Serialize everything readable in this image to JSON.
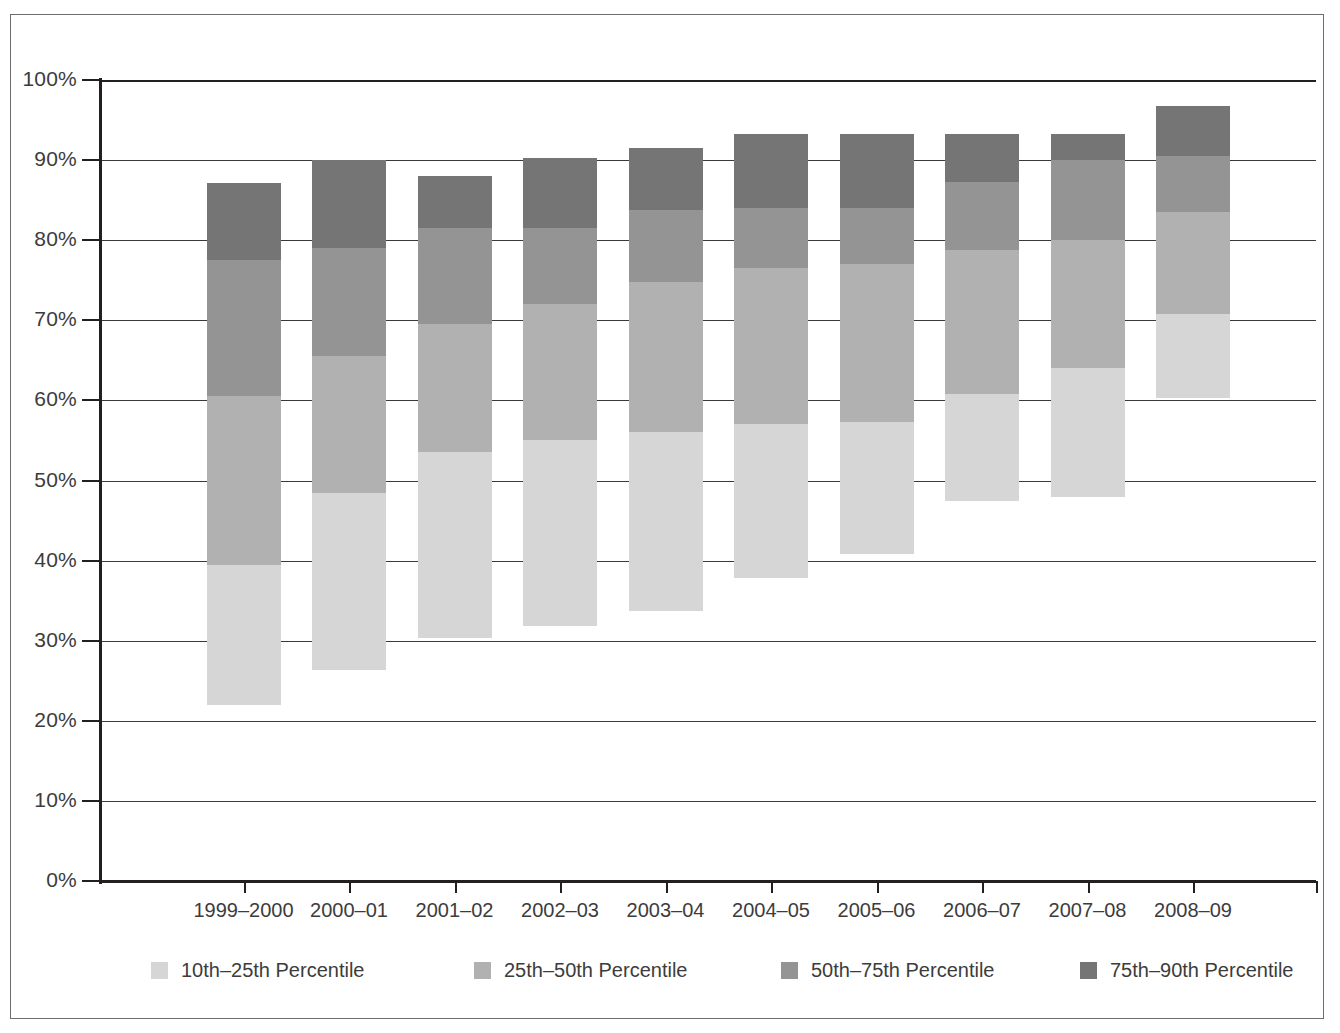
{
  "chart_data": {
    "type": "bar",
    "subtype": "stacked-bar",
    "title": "",
    "xlabel": "",
    "ylabel": "",
    "ylim": [
      0,
      100
    ],
    "y_unit": "%",
    "grid": true,
    "legend_position": "bottom",
    "y_ticks": [
      "0%",
      "10%",
      "20%",
      "30%",
      "40%",
      "50%",
      "60%",
      "70%",
      "80%",
      "90%",
      "100%"
    ],
    "y_tick_values": [
      0,
      10,
      20,
      30,
      40,
      50,
      60,
      70,
      80,
      90,
      100
    ],
    "categories": [
      "1999–2000",
      "2000–01",
      "2001–02",
      "2002–03",
      "2003–04",
      "2004–05",
      "2005–06",
      "2006–07",
      "2007–08",
      "2008–09"
    ],
    "series": [
      {
        "name": "10th–25th Percentile",
        "color": "#d6d6d6",
        "baselines": [
          22.0,
          26.3,
          30.3,
          31.8,
          33.7,
          37.8,
          40.8,
          47.5,
          48.0,
          60.3
        ],
        "tops": [
          39.5,
          48.5,
          53.5,
          55.0,
          56.0,
          57.0,
          57.3,
          60.8,
          64.0,
          70.8
        ],
        "values": [
          17.5,
          22.2,
          23.2,
          23.2,
          22.3,
          19.2,
          16.5,
          13.3,
          16.0,
          10.5
        ]
      },
      {
        "name": "25th–50th Percentile",
        "color": "#b1b1b1",
        "baselines": [
          39.5,
          48.5,
          53.5,
          55.0,
          56.0,
          57.0,
          57.3,
          60.8,
          64.0,
          70.8
        ],
        "tops": [
          60.5,
          65.5,
          69.5,
          72.0,
          74.8,
          76.5,
          77.0,
          78.8,
          80.0,
          83.5
        ],
        "values": [
          21.0,
          17.0,
          16.0,
          17.0,
          18.8,
          19.5,
          19.7,
          18.0,
          16.0,
          12.7
        ]
      },
      {
        "name": "50th–75th Percentile",
        "color": "#949494",
        "baselines": [
          60.5,
          65.5,
          69.5,
          72.0,
          74.8,
          76.5,
          77.0,
          78.8,
          80.0,
          83.5
        ],
        "tops": [
          77.5,
          79.0,
          81.5,
          81.5,
          83.8,
          84.0,
          84.0,
          87.3,
          90.0,
          90.5
        ],
        "values": [
          17.0,
          13.5,
          12.0,
          9.5,
          9.0,
          7.5,
          7.0,
          8.5,
          10.0,
          7.0
        ]
      },
      {
        "name": "75th–90th Percentile",
        "color": "#757575",
        "baselines": [
          77.5,
          79.0,
          81.5,
          81.5,
          83.8,
          84.0,
          84.0,
          87.3,
          90.0,
          90.5
        ],
        "tops": [
          87.2,
          90.0,
          88.0,
          90.3,
          91.5,
          93.2,
          93.3,
          93.2,
          93.2,
          96.8
        ],
        "values": [
          9.7,
          11.0,
          6.5,
          8.8,
          7.7,
          9.2,
          9.3,
          5.9,
          3.2,
          6.3
        ]
      }
    ],
    "bar_totals_top": [
      87.2,
      90.0,
      88.0,
      90.3,
      91.5,
      93.2,
      93.3,
      93.2,
      93.2,
      96.8
    ],
    "bar_bottoms": [
      22.0,
      26.3,
      30.3,
      31.8,
      33.7,
      37.8,
      40.8,
      47.5,
      48.0,
      60.3
    ]
  },
  "legend": {
    "items": [
      {
        "label": "10th–25th Percentile",
        "color": "#d6d6d6"
      },
      {
        "label": "25th–50th Percentile",
        "color": "#b1b1b1"
      },
      {
        "label": "50th–75th Percentile",
        "color": "#949494"
      },
      {
        "label": "75th–90th Percentile",
        "color": "#757575"
      }
    ]
  }
}
